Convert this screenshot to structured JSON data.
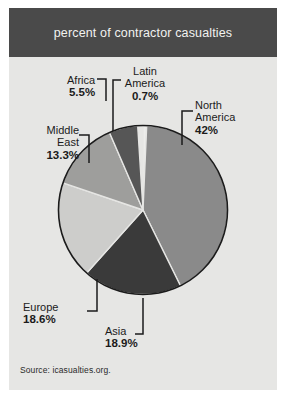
{
  "header": {
    "title": "percent of contractor casualties"
  },
  "source": {
    "text": "Source: icasualties.org."
  },
  "colors": {
    "title_bar": "#4a4a4a",
    "title_text": "#f2f2f0",
    "card_background": "#e6e6e4",
    "page_background": "#ffffff",
    "pie_outline": "#1b1b1b",
    "label_text": "#1b1b1b",
    "leader_line": "#1b1b1b"
  },
  "chart_data": {
    "type": "pie",
    "title": "percent of contractor casualties",
    "source": "Source: icasualties.org.",
    "unit": "percent",
    "legend": "none-labels-with-leader-lines",
    "total": 99.0,
    "categories": [
      "Latin America",
      "North America",
      "Asia",
      "Europe",
      "Middle East",
      "Africa"
    ],
    "values": [
      0.7,
      42,
      18.9,
      18.6,
      13.3,
      5.5
    ],
    "slices": [
      {
        "label": "Latin America",
        "label_line1": "Latin",
        "label_line2": "America",
        "value": 0.7,
        "value_text": "0.7%",
        "color": "#ededeb",
        "start_angle": 0,
        "end_angle": 2.52
      },
      {
        "label": "North America",
        "label_line1": "North",
        "label_line2": "America",
        "value": 42,
        "value_text": "42%",
        "color": "#8a8a8a",
        "start_angle": 2.52,
        "end_angle": 153.72
      },
      {
        "label": "Asia",
        "label_line1": "Asia",
        "label_line2": "",
        "value": 18.9,
        "value_text": "18.9%",
        "color": "#3a3a3a",
        "start_angle": 153.72,
        "end_angle": 221.76
      },
      {
        "label": "Europe",
        "label_line1": "Europe",
        "label_line2": "",
        "value": 18.6,
        "value_text": "18.6%",
        "color": "#cdcdcb",
        "start_angle": 221.76,
        "end_angle": 288.72
      },
      {
        "label": "Middle East",
        "label_line1": "Middle",
        "label_line2": "East",
        "value": 13.3,
        "value_text": "13.3%",
        "color": "#9e9e9c",
        "start_angle": 288.72,
        "end_angle": 336.6
      },
      {
        "label": "Africa",
        "label_line1": "Africa",
        "label_line2": "",
        "value": 5.5,
        "value_text": "5.5%",
        "color": "#565656",
        "start_angle": 336.6,
        "end_angle": 356.4
      }
    ]
  }
}
